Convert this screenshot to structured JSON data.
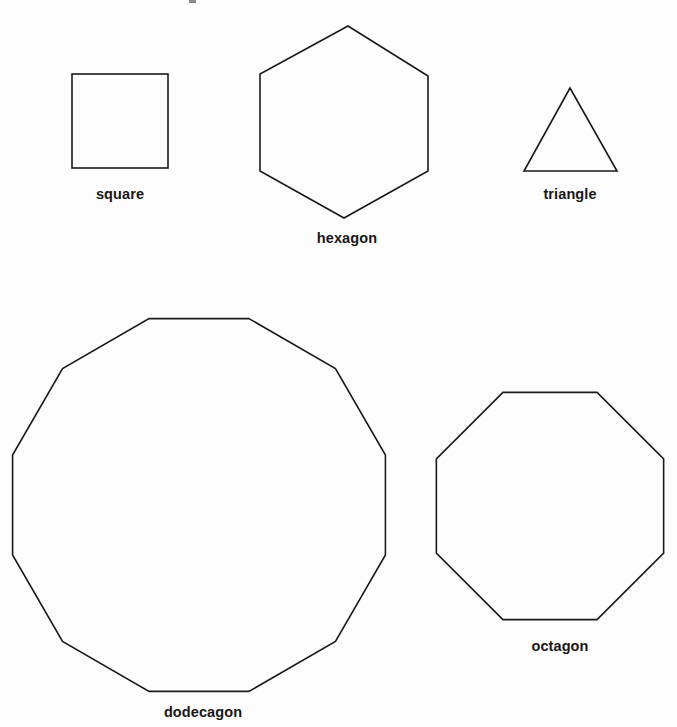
{
  "page": {
    "background_color": "#fdfdfd",
    "stroke_color": "#1a1a1a",
    "label_color": "#171717",
    "width": 677,
    "height": 727
  },
  "figure": {
    "type": "geometry-diagram",
    "shapes": [
      {
        "id": "square",
        "label": "square",
        "sides": 4,
        "geometry": "rect",
        "x": 72,
        "y": 74,
        "width": 96,
        "height": 94,
        "label_x": 120,
        "label_y": 186
      },
      {
        "id": "hexagon",
        "label": "hexagon",
        "sides": 6,
        "geometry": "polygon",
        "points": [
          [
            348,
            26
          ],
          [
            428,
            76
          ],
          [
            428,
            171
          ],
          [
            344,
            218
          ],
          [
            260,
            171
          ],
          [
            260,
            74
          ]
        ],
        "label_x": 347,
        "label_y": 230
      },
      {
        "id": "triangle",
        "label": "triangle",
        "sides": 3,
        "geometry": "polygon",
        "points": [
          [
            570,
            88
          ],
          [
            617,
            171
          ],
          [
            524,
            171
          ]
        ],
        "label_x": 570,
        "label_y": 186
      },
      {
        "id": "dodecagon",
        "label": "dodecagon",
        "sides": 12,
        "geometry": "regular-polygon",
        "center_x": 199,
        "center_y": 505,
        "radius": 193,
        "rotation_deg": 15,
        "label_x": 203,
        "label_y": 704
      },
      {
        "id": "octagon",
        "label": "octagon",
        "sides": 8,
        "geometry": "regular-polygon",
        "center_x": 550,
        "center_y": 506,
        "radius": 123,
        "rotation_deg": 22.5,
        "label_x": 560,
        "label_y": 638
      }
    ],
    "specks": [
      {
        "x": 189,
        "y": 0,
        "width": 7,
        "height": 3
      }
    ]
  }
}
